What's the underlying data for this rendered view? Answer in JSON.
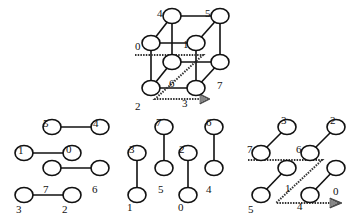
{
  "diagram": {
    "type": "hypercube-decomposition",
    "node_radius": 8,
    "colors": {
      "stroke": "#111111",
      "background": "#ffffff",
      "dashed": "#333333"
    },
    "panels": [
      {
        "id": "cube",
        "nodes": [
          {
            "label": "4",
            "x": 172,
            "y": 16,
            "lx": 157,
            "ly": 9
          },
          {
            "label": "5",
            "x": 220,
            "y": 16,
            "lx": 205,
            "ly": 9
          },
          {
            "label": "0",
            "x": 151,
            "y": 43,
            "lx": 135,
            "ly": 42
          },
          {
            "label": "1",
            "x": 196,
            "y": 43,
            "lx": 183,
            "ly": 40
          },
          {
            "label": "6",
            "x": 172,
            "y": 62,
            "lx": 169,
            "ly": 79
          },
          {
            "label": "7",
            "x": 220,
            "y": 62,
            "lx": 217,
            "ly": 81
          },
          {
            "label": "2",
            "x": 151,
            "y": 88,
            "lx": 135,
            "ly": 102
          },
          {
            "label": "3",
            "x": 196,
            "y": 88,
            "lx": 182,
            "ly": 99
          }
        ],
        "edges": [
          [
            "0",
            "1"
          ],
          [
            "4",
            "5"
          ],
          [
            "2",
            "3"
          ],
          [
            "6",
            "7"
          ],
          [
            "0",
            "4"
          ],
          [
            "1",
            "5"
          ],
          [
            "2",
            "6"
          ],
          [
            "3",
            "7"
          ],
          [
            "0",
            "2"
          ],
          [
            "1",
            "3"
          ],
          [
            "4",
            "6"
          ],
          [
            "5",
            "7"
          ]
        ],
        "dashed_path": [
          [
            135,
            55
          ],
          [
            203,
            55
          ],
          [
            155,
            99
          ],
          [
            200,
            99
          ]
        ],
        "arrow_tip": [
          210,
          99
        ]
      },
      {
        "id": "left",
        "nodes": [
          {
            "label": "5",
            "x": 52,
            "y": 127,
            "lx": 43,
            "ly": 119
          },
          {
            "label": "4",
            "x": 100,
            "y": 127,
            "lx": 93,
            "ly": 119
          },
          {
            "label": "1",
            "x": 24,
            "y": 153,
            "lx": 18,
            "ly": 146
          },
          {
            "label": "0",
            "x": 72,
            "y": 153,
            "lx": 66,
            "ly": 145
          },
          {
            "label": "7",
            "x": 52,
            "y": 168,
            "lx": 43,
            "ly": 185
          },
          {
            "label": "6",
            "x": 100,
            "y": 168,
            "lx": 92,
            "ly": 185
          },
          {
            "label": "3",
            "x": 24,
            "y": 195,
            "lx": 16,
            "ly": 205
          },
          {
            "label": "2",
            "x": 72,
            "y": 195,
            "lx": 62,
            "ly": 205
          }
        ],
        "edges": [
          [
            "5",
            "4"
          ],
          [
            "1",
            "0"
          ],
          [
            "7",
            "6"
          ],
          [
            "3",
            "2"
          ]
        ]
      },
      {
        "id": "middle",
        "nodes": [
          {
            "label": "7",
            "x": 164,
            "y": 127,
            "lx": 156,
            "ly": 118
          },
          {
            "label": "6",
            "x": 214,
            "y": 127,
            "lx": 206,
            "ly": 118
          },
          {
            "label": "3",
            "x": 137,
            "y": 153,
            "lx": 129,
            "ly": 145
          },
          {
            "label": "2",
            "x": 188,
            "y": 153,
            "lx": 179,
            "ly": 145
          },
          {
            "label": "5",
            "x": 164,
            "y": 168,
            "lx": 158,
            "ly": 185
          },
          {
            "label": "4",
            "x": 214,
            "y": 168,
            "lx": 206,
            "ly": 185
          },
          {
            "label": "1",
            "x": 137,
            "y": 195,
            "lx": 127,
            "ly": 203
          },
          {
            "label": "0",
            "x": 188,
            "y": 195,
            "lx": 178,
            "ly": 203
          }
        ],
        "edges": [
          [
            "3",
            "1"
          ],
          [
            "7",
            "5"
          ],
          [
            "2",
            "0"
          ],
          [
            "6",
            "4"
          ]
        ]
      },
      {
        "id": "right",
        "nodes": [
          {
            "label": "3",
            "x": 287,
            "y": 127,
            "lx": 281,
            "ly": 116
          },
          {
            "label": "2",
            "x": 336,
            "y": 127,
            "lx": 330,
            "ly": 116
          },
          {
            "label": "7",
            "x": 261,
            "y": 153,
            "lx": 247,
            "ly": 145
          },
          {
            "label": "6",
            "x": 310,
            "y": 153,
            "lx": 296,
            "ly": 145
          },
          {
            "label": "1",
            "x": 287,
            "y": 168,
            "lx": 285,
            "ly": 184
          },
          {
            "label": "0",
            "x": 336,
            "y": 168,
            "lx": 333,
            "ly": 187
          },
          {
            "label": "5",
            "x": 261,
            "y": 195,
            "lx": 248,
            "ly": 205
          },
          {
            "label": "4",
            "x": 310,
            "y": 195,
            "lx": 297,
            "ly": 202
          }
        ],
        "edges": [
          [
            "7",
            "3"
          ],
          [
            "6",
            "2"
          ],
          [
            "5",
            "1"
          ],
          [
            "4",
            "0"
          ]
        ],
        "dashed_path": [
          [
            248,
            160
          ],
          [
            322,
            160
          ],
          [
            276,
            203
          ],
          [
            330,
            203
          ]
        ],
        "arrow_tip": [
          342,
          203
        ]
      }
    ]
  }
}
